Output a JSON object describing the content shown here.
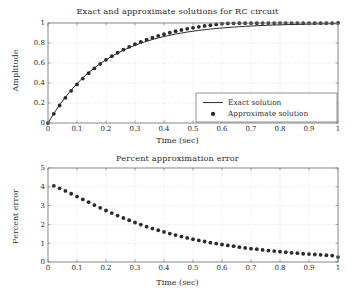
{
  "figure": {
    "width": 355,
    "height": 301,
    "background": "#ffffff",
    "axis_color": "#7a7a7a",
    "grid_color": "#b8b8b8",
    "series_color": "#2b2b2b"
  },
  "chart_data": [
    {
      "type": "line",
      "title": "Exact and approximate solutions for RC circuit",
      "xlabel": "Time (sec)",
      "ylabel": "Amplitude",
      "xlim": [
        0,
        1
      ],
      "ylim": [
        0,
        1
      ],
      "grid": true,
      "legend_position": "lower right",
      "xticks": [
        0,
        0.1,
        0.2,
        0.3,
        0.4,
        0.5,
        0.6,
        0.7,
        0.8,
        0.9,
        1
      ],
      "xticklabels": [
        "0",
        "0.1",
        "0.2",
        "0.3",
        "0.4",
        "0.5",
        "0.6",
        "0.7",
        "0.8",
        "0.9",
        "1"
      ],
      "yticks": [
        0,
        0.2,
        0.4,
        0.6,
        0.8,
        1
      ],
      "yticklabels": [
        "0",
        "0.2",
        "0.4",
        "0.6",
        "0.8",
        "1"
      ],
      "series": [
        {
          "name": "Exact solution",
          "style": "line",
          "x": [
            0,
            0.02,
            0.04,
            0.06,
            0.08,
            0.1,
            0.12,
            0.14,
            0.16,
            0.18,
            0.2,
            0.22,
            0.24,
            0.26,
            0.28,
            0.3,
            0.32,
            0.34,
            0.36,
            0.38,
            0.4,
            0.42,
            0.44,
            0.46,
            0.48,
            0.5,
            0.52,
            0.54,
            0.56,
            0.58,
            0.6,
            0.62,
            0.64,
            0.66,
            0.68,
            0.7,
            0.72,
            0.74,
            0.76,
            0.78,
            0.8,
            0.82,
            0.84,
            0.86,
            0.88,
            0.9,
            0.92,
            0.94,
            0.96,
            0.98,
            1
          ],
          "values": [
            0,
            0.0952,
            0.1813,
            0.2592,
            0.3297,
            0.3935,
            0.4512,
            0.5034,
            0.5507,
            0.5934,
            0.6321,
            0.6671,
            0.6988,
            0.7275,
            0.7534,
            0.7769,
            0.7981,
            0.8173,
            0.8347,
            0.8504,
            0.8647,
            0.8775,
            0.8892,
            0.8997,
            0.9093,
            0.9179,
            0.9257,
            0.9328,
            0.9392,
            0.945,
            0.9502,
            0.955,
            0.9592,
            0.9631,
            0.9666,
            0.9698,
            0.9727,
            0.9753,
            0.9776,
            0.9798,
            0.9817,
            0.9834,
            0.985,
            0.9864,
            0.9877,
            0.9889,
            0.9899,
            0.9909,
            0.9918,
            0.9925,
            0.9933
          ]
        },
        {
          "name": "Approximate solution",
          "style": "marker",
          "x": [
            0,
            0.02,
            0.04,
            0.06,
            0.08,
            0.1,
            0.12,
            0.14,
            0.16,
            0.18,
            0.2,
            0.22,
            0.24,
            0.26,
            0.28,
            0.3,
            0.32,
            0.34,
            0.36,
            0.38,
            0.4,
            0.42,
            0.44,
            0.46,
            0.48,
            0.5,
            0.52,
            0.54,
            0.56,
            0.58,
            0.6,
            0.62,
            0.64,
            0.66,
            0.68,
            0.7,
            0.72,
            0.74,
            0.76,
            0.78,
            0.8,
            0.82,
            0.84,
            0.86,
            0.88,
            0.9,
            0.92,
            0.94,
            0.96,
            0.98,
            1
          ],
          "values": [
            0,
            0.0914,
            0.1751,
            0.2516,
            0.3216,
            0.3855,
            0.4439,
            0.4973,
            0.546,
            0.5906,
            0.6313,
            0.6685,
            0.7025,
            0.7336,
            0.7621,
            0.7881,
            0.8119,
            0.8336,
            0.8535,
            0.8717,
            0.8883,
            0.9035,
            0.9174,
            0.93,
            0.9416,
            0.9522,
            0.9618,
            0.9706,
            0.9787,
            0.986,
            0.9927,
            0.9955,
            0.997,
            0.9978,
            0.9982,
            0.9985,
            0.9987,
            0.9989,
            0.999,
            0.9991,
            0.9992,
            0.9993,
            0.9994,
            0.9995,
            0.9995,
            0.9996,
            0.9996,
            0.9997,
            0.9997,
            0.9997,
            0.9998
          ]
        }
      ],
      "legend": [
        {
          "label": "Exact solution",
          "marker": "line"
        },
        {
          "label": "Approximate solution",
          "marker": "dot"
        }
      ]
    },
    {
      "type": "scatter",
      "title": "Percent approximation error",
      "xlabel": "Time (sec)",
      "ylabel": "Percent error",
      "xlim": [
        0,
        1
      ],
      "ylim": [
        0,
        5
      ],
      "grid": true,
      "xticks": [
        0,
        0.1,
        0.2,
        0.3,
        0.4,
        0.5,
        0.6,
        0.7,
        0.8,
        0.9,
        1
      ],
      "xticklabels": [
        "0",
        "0.1",
        "0.2",
        "0.3",
        "0.4",
        "0.5",
        "0.6",
        "0.7",
        "0.8",
        "0.9",
        "1"
      ],
      "yticks": [
        0,
        1,
        2,
        3,
        4,
        5
      ],
      "yticklabels": [
        "0",
        "1",
        "2",
        "3",
        "4",
        "5"
      ],
      "series": [
        {
          "name": "Percent error",
          "style": "marker",
          "x": [
            0.02,
            0.04,
            0.06,
            0.08,
            0.1,
            0.12,
            0.14,
            0.16,
            0.18,
            0.2,
            0.22,
            0.24,
            0.26,
            0.28,
            0.3,
            0.32,
            0.34,
            0.36,
            0.38,
            0.4,
            0.42,
            0.44,
            0.46,
            0.48,
            0.5,
            0.52,
            0.54,
            0.56,
            0.58,
            0.6,
            0.62,
            0.64,
            0.66,
            0.68,
            0.7,
            0.72,
            0.74,
            0.76,
            0.78,
            0.8,
            0.82,
            0.84,
            0.86,
            0.88,
            0.9,
            0.92,
            0.94,
            0.96,
            0.98,
            1
          ],
          "values": [
            4.05,
            3.92,
            3.78,
            3.63,
            3.48,
            3.33,
            3.18,
            3.03,
            2.88,
            2.74,
            2.6,
            2.47,
            2.34,
            2.22,
            2.1,
            1.99,
            1.88,
            1.78,
            1.69,
            1.6,
            1.51,
            1.43,
            1.35,
            1.28,
            1.21,
            1.15,
            1.09,
            1.03,
            0.98,
            0.93,
            0.88,
            0.84,
            0.79,
            0.75,
            0.71,
            0.68,
            0.64,
            0.61,
            0.58,
            0.55,
            0.52,
            0.49,
            0.47,
            0.44,
            0.42,
            0.4,
            0.38,
            0.36,
            0.34,
            0.26
          ]
        }
      ]
    }
  ]
}
